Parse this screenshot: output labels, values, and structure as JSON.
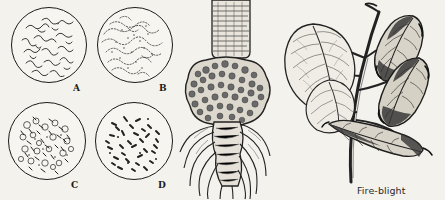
{
  "plate": {
    "title": "Bacterial plant disease illustration plate",
    "background_color": "#f4f2ec",
    "ink_color": "#1b1b1b",
    "width": 445,
    "height": 200
  },
  "fields": [
    {
      "label": "A",
      "name": "microscope-field-a",
      "description": "spiral and filamentous bacteria scattered in field",
      "morphology": "spirilla",
      "cx": 48,
      "cy": 44,
      "r": 37,
      "label_x": 73,
      "label_y": 83
    },
    {
      "label": "B",
      "name": "microscope-field-b",
      "description": "dense irregular clustered bacterial colonies",
      "morphology": "clustered-colonies",
      "cx": 134,
      "cy": 44,
      "r": 37,
      "label_x": 159,
      "label_y": 83
    },
    {
      "label": "C",
      "name": "microscope-field-c",
      "description": "mixed cocci, rods and round cells in clumps",
      "morphology": "cocci-and-rods",
      "cx": 46,
      "cy": 140,
      "r": 38,
      "label_x": 71,
      "label_y": 180
    },
    {
      "label": "D",
      "name": "microscope-field-d",
      "description": "sparse scattered rod-shaped bacteria",
      "morphology": "bacilli",
      "cx": 133,
      "cy": 140,
      "r": 38,
      "label_x": 158,
      "label_y": 180
    }
  ],
  "center_illustration": {
    "name": "crown-gall-root",
    "description": "woody stem with large crown gall tumour above the root system"
  },
  "right_illustration": {
    "name": "fire-blight-branch",
    "description": "plant branch with healthy leaves at left and blighted withered leaves at right"
  },
  "caption": {
    "text": "Fire-blight",
    "x": 357,
    "y": 186
  }
}
